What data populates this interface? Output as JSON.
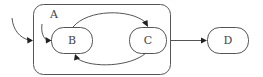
{
  "diagram": {
    "type": "statechart",
    "colors": {
      "stroke": "#555555",
      "arrowhead": "#222222",
      "label": "#444444",
      "background": "#ffffff"
    },
    "container": {
      "id": "A",
      "label": "A",
      "children": [
        "B",
        "C"
      ]
    },
    "states": [
      {
        "id": "B",
        "label": "B"
      },
      {
        "id": "C",
        "label": "C"
      },
      {
        "id": "D",
        "label": "D"
      }
    ],
    "transitions": [
      {
        "from": "initial",
        "to": "A",
        "kind": "initial-outer"
      },
      {
        "from": "initial",
        "to": "B",
        "kind": "initial-inner"
      },
      {
        "from": "B",
        "to": "C",
        "kind": "arc-top"
      },
      {
        "from": "C",
        "to": "B",
        "kind": "arc-bottom"
      },
      {
        "from": "A",
        "to": "D",
        "kind": "straight"
      }
    ]
  }
}
